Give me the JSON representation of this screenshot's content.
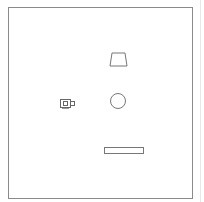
{
  "canvas": {
    "stroke_color": "#777777",
    "frame_color": "#8a8a8a",
    "background": "#ffffff"
  },
  "shapes": [
    {
      "type": "trapezoid",
      "name": "trapezoid-shape"
    },
    {
      "type": "circle",
      "name": "circle-shape"
    },
    {
      "type": "rectangle",
      "name": "rectangle-shape"
    },
    {
      "type": "icon",
      "name": "camera-icon"
    }
  ]
}
